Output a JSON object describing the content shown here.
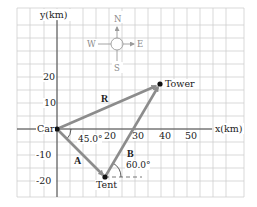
{
  "axes": {
    "x_label": "x(km)",
    "y_label": "y(km)",
    "x_ticks": [
      "20",
      "30",
      "40",
      "50"
    ],
    "y_ticks": [
      "20",
      "10",
      "-10",
      "-20"
    ]
  },
  "compass": {
    "north": "N",
    "south": "S",
    "east": "E",
    "west": "W"
  },
  "points": {
    "car": {
      "label": "Car",
      "x_km": 0,
      "y_km": 0
    },
    "tent": {
      "label": "Tent",
      "x_km": 18.4,
      "y_km": -18.4
    },
    "tower": {
      "label": "Tower",
      "x_km": 39.6,
      "y_km": 17.3
    }
  },
  "vectors": {
    "A": {
      "label": "A",
      "angle": "45.0°"
    },
    "B": {
      "label": "B",
      "angle": "60.0°"
    },
    "R": {
      "label": "R"
    }
  },
  "colors": {
    "grid": "#cfcfcf",
    "axis": "#333333",
    "vector": "#8c8c8c",
    "point": "#111111",
    "compass": "#9a9a9a"
  }
}
